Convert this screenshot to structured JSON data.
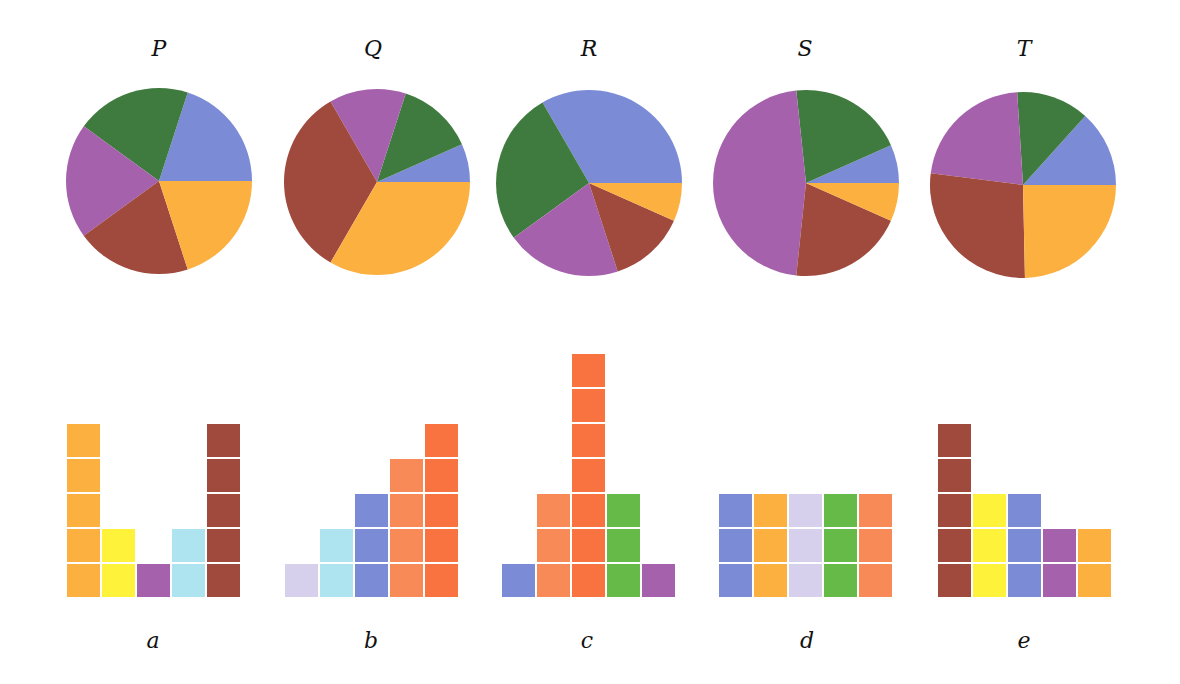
{
  "colors": {
    "blue": "#7b8bd6",
    "green": "#3f7a3f",
    "purple": "#a661ad",
    "brown": "#a0493d",
    "orange": "#fbb040",
    "yellow": "#fff23a",
    "light_blue": "#aee4f0",
    "lavender": "#d6d0ec",
    "salmon": "#f88a58",
    "orange_red": "#f8733f",
    "light_green": "#66bb48"
  },
  "chart_data": [
    {
      "type": "pie",
      "title": "P",
      "slice_order": "counterclockwise from 3 o'clock",
      "labels": [
        "blue",
        "green",
        "purple",
        "brown",
        "orange"
      ],
      "values": [
        3,
        3,
        3,
        3,
        3
      ]
    },
    {
      "type": "pie",
      "title": "Q",
      "slice_order": "counterclockwise from 3 o'clock",
      "labels": [
        "blue",
        "green",
        "purple",
        "brown",
        "orange"
      ],
      "values": [
        1,
        2,
        2,
        5,
        5
      ]
    },
    {
      "type": "pie",
      "title": "R",
      "slice_order": "counterclockwise from 3 o'clock",
      "labels": [
        "blue",
        "green",
        "purple",
        "brown",
        "orange"
      ],
      "values": [
        5,
        4,
        3,
        2,
        1
      ]
    },
    {
      "type": "pie",
      "title": "S",
      "slice_order": "counterclockwise from 3 o'clock",
      "labels": [
        "blue",
        "green",
        "purple",
        "brown",
        "orange"
      ],
      "values": [
        1,
        3,
        7,
        3,
        1
      ]
    },
    {
      "type": "pie",
      "title": "T",
      "slice_order": "counterclockwise from 3 o'clock",
      "labels": [
        "blue",
        "green",
        "purple",
        "brown",
        "orange"
      ],
      "values": [
        2,
        1.9,
        3.3,
        4.1,
        3.7
      ]
    },
    {
      "type": "bar",
      "title": "a",
      "unit": "stacked unit blocks",
      "categories": [
        "orange",
        "yellow",
        "purple",
        "light_blue",
        "brown"
      ],
      "values": [
        5,
        2,
        1,
        2,
        5
      ]
    },
    {
      "type": "bar",
      "title": "b",
      "unit": "stacked unit blocks",
      "categories": [
        "lavender",
        "light_blue",
        "blue",
        "salmon",
        "orange_red"
      ],
      "values": [
        1,
        2,
        3,
        4,
        5
      ]
    },
    {
      "type": "bar",
      "title": "c",
      "unit": "stacked unit blocks",
      "categories": [
        "blue",
        "salmon",
        "orange_red",
        "light_green",
        "purple"
      ],
      "values": [
        1,
        3,
        7,
        3,
        1
      ]
    },
    {
      "type": "bar",
      "title": "d",
      "unit": "stacked unit blocks",
      "categories": [
        "blue",
        "orange",
        "lavender",
        "light_green",
        "salmon"
      ],
      "values": [
        3,
        3,
        3,
        3,
        3
      ]
    },
    {
      "type": "bar",
      "title": "e",
      "unit": "stacked unit blocks",
      "categories": [
        "brown",
        "yellow",
        "blue",
        "purple",
        "orange"
      ],
      "values": [
        5,
        3,
        3,
        2,
        2
      ]
    }
  ],
  "layout": {
    "pies": [
      {
        "cx": 159,
        "cy": 181,
        "r": 93
      },
      {
        "cx": 377,
        "cy": 182,
        "r": 93
      },
      {
        "cx": 589,
        "cy": 183,
        "r": 93
      },
      {
        "cx": 806,
        "cy": 183,
        "r": 93
      },
      {
        "cx": 1023,
        "cy": 185,
        "r": 93
      }
    ],
    "bars": [
      {
        "x": 67
      },
      {
        "x": 285
      },
      {
        "x": 502
      },
      {
        "x": 719
      },
      {
        "x": 938
      }
    ],
    "bar_baseline": 597,
    "block_w": 33,
    "block_h": 33,
    "block_step_x": 35,
    "block_step_y": 35
  }
}
